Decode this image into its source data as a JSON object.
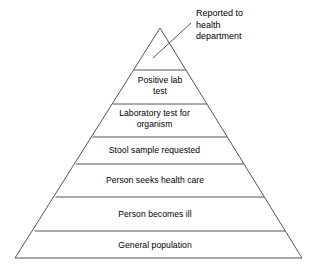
{
  "diagram": {
    "type": "pyramid",
    "name": "surveillance-pyramid",
    "stroke_color": "#555555",
    "text_color": "#000000",
    "background_color": "#ffffff",
    "apex": {
      "x": 160,
      "y": 28
    },
    "base_left": {
      "x": 15,
      "y": 258
    },
    "base_right": {
      "x": 302,
      "y": 258
    },
    "divider_y": [
      70,
      104,
      137,
      164,
      197,
      231
    ],
    "callout": {
      "label": "Reported to\nhealth\ndepartment",
      "line1": "Reported to",
      "line2": "health",
      "line3": "department",
      "leader_from": {
        "x": 155,
        "y": 57
      },
      "leader_to": {
        "x": 190,
        "y": 24
      }
    },
    "tiers": [
      {
        "index": 1,
        "label": "Reported to health department",
        "display": "",
        "external": true,
        "top_y": 28,
        "bottom_y": 70
      },
      {
        "index": 2,
        "label": "Positive lab test",
        "display": "Positive lab\ntest",
        "external": false,
        "top_y": 70,
        "bottom_y": 104
      },
      {
        "index": 3,
        "label": "Laboratory test for organism",
        "display": "Laboratory test for\norganism",
        "external": false,
        "top_y": 104,
        "bottom_y": 137
      },
      {
        "index": 4,
        "label": "Stool sample requested",
        "display": "Stool sample requested",
        "external": false,
        "top_y": 137,
        "bottom_y": 164
      },
      {
        "index": 5,
        "label": "Person seeks health care",
        "display": "Person seeks health care",
        "external": false,
        "top_y": 164,
        "bottom_y": 197
      },
      {
        "index": 6,
        "label": "Person becomes ill",
        "display": "Person becomes ill",
        "external": false,
        "top_y": 197,
        "bottom_y": 231
      },
      {
        "index": 7,
        "label": "General population",
        "display": "General population",
        "external": false,
        "top_y": 231,
        "bottom_y": 258
      }
    ]
  }
}
